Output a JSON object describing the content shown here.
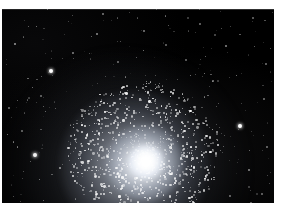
{
  "image": {
    "subject": "globular-star-cluster",
    "kind": "astronomical-photograph",
    "title": "Globular star cluster",
    "alt_text": "Dense spherical swarm of stars with a bright unresolved core on a black sky field scattered with faint field stars",
    "visible_text": "",
    "frame": {
      "width_px": 287,
      "height_px": 203,
      "margin_color": "#ffffff",
      "sky_color": "#000000",
      "star_color": "#ffffff",
      "plate_left_px": 2,
      "plate_top_px": 9,
      "plate_width_px": 272,
      "plate_height_px": 194
    },
    "cluster": {
      "core_x_px": 144,
      "core_y_px": 152,
      "core_radius_px": 17,
      "halo_radius_px": 72,
      "core_brightness": "saturated-white"
    },
    "field_stars": [
      {
        "x": 51,
        "y": 71,
        "r": 2.3,
        "b": 1.0
      },
      {
        "x": 240,
        "y": 126,
        "r": 2.4,
        "b": 1.0
      },
      {
        "x": 35,
        "y": 155,
        "r": 2.0,
        "b": 0.95
      },
      {
        "x": 15,
        "y": 44,
        "r": 1.1,
        "b": 0.6
      },
      {
        "x": 73,
        "y": 53,
        "r": 0.9,
        "b": 0.5
      },
      {
        "x": 97,
        "y": 34,
        "r": 1.0,
        "b": 0.55
      },
      {
        "x": 144,
        "y": 31,
        "r": 1.0,
        "b": 0.5
      },
      {
        "x": 200,
        "y": 24,
        "r": 0.9,
        "b": 0.45
      },
      {
        "x": 226,
        "y": 46,
        "r": 1.1,
        "b": 0.55
      },
      {
        "x": 253,
        "y": 18,
        "r": 0.8,
        "b": 0.4
      },
      {
        "x": 266,
        "y": 64,
        "r": 0.9,
        "b": 0.45
      },
      {
        "x": 213,
        "y": 81,
        "r": 1.0,
        "b": 0.5
      },
      {
        "x": 264,
        "y": 99,
        "r": 0.9,
        "b": 0.45
      },
      {
        "x": 9,
        "y": 108,
        "r": 0.9,
        "b": 0.45
      },
      {
        "x": 22,
        "y": 131,
        "r": 0.8,
        "b": 0.4
      },
      {
        "x": 60,
        "y": 168,
        "r": 1.2,
        "b": 0.6
      },
      {
        "x": 83,
        "y": 190,
        "r": 1.0,
        "b": 0.5
      },
      {
        "x": 249,
        "y": 170,
        "r": 1.1,
        "b": 0.55
      },
      {
        "x": 230,
        "y": 196,
        "r": 0.9,
        "b": 0.45
      },
      {
        "x": 186,
        "y": 60,
        "r": 0.8,
        "b": 0.4
      },
      {
        "x": 118,
        "y": 62,
        "r": 0.9,
        "b": 0.45
      },
      {
        "x": 166,
        "y": 45,
        "r": 0.8,
        "b": 0.4
      },
      {
        "x": 41,
        "y": 96,
        "r": 0.8,
        "b": 0.4
      },
      {
        "x": 267,
        "y": 147,
        "r": 0.9,
        "b": 0.45
      }
    ]
  }
}
